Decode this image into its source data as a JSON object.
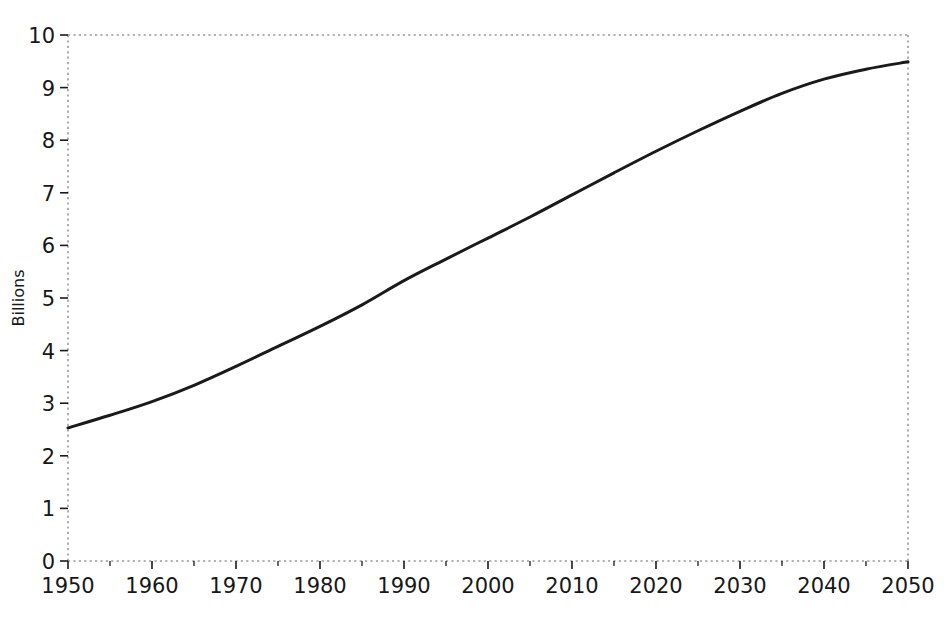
{
  "chart_data": {
    "type": "line",
    "title": "",
    "subtitle": "",
    "xlabel": "",
    "ylabel": "Billions",
    "xlim": [
      1950,
      2050
    ],
    "ylim": [
      0,
      10
    ],
    "grid": false,
    "legend": null,
    "x_major_ticks": [
      1950,
      1960,
      1970,
      1980,
      1990,
      2000,
      2010,
      2020,
      2030,
      2040,
      2050
    ],
    "x_minor_ticks": [
      1955,
      1965,
      1975,
      1985,
      1995,
      2005,
      2015,
      2025,
      2035,
      2045
    ],
    "x_tick_labels": [
      "1950",
      "1960",
      "1970",
      "1980",
      "1990",
      "2000",
      "2010",
      "2020",
      "2030",
      "2040",
      "2050"
    ],
    "y_major_ticks": [
      0,
      1,
      2,
      3,
      4,
      5,
      6,
      7,
      8,
      9,
      10
    ],
    "y_tick_labels": [
      "0",
      "1",
      "2",
      "3",
      "4",
      "5",
      "6",
      "7",
      "8",
      "9",
      "10"
    ],
    "series": [
      {
        "name": "World population",
        "color": "#1a1a1a",
        "line_width": 3,
        "x": [
          1950,
          1955,
          1960,
          1965,
          1970,
          1975,
          1980,
          1985,
          1990,
          1995,
          2000,
          2005,
          2010,
          2015,
          2020,
          2025,
          2030,
          2035,
          2040,
          2045,
          2050
        ],
        "values": [
          2.53,
          2.77,
          3.03,
          3.34,
          3.7,
          4.08,
          4.46,
          4.87,
          5.33,
          5.74,
          6.14,
          6.54,
          6.96,
          7.38,
          7.79,
          8.18,
          8.55,
          8.89,
          9.16,
          9.35,
          9.49
        ]
      }
    ],
    "axis_style": {
      "spine_color": "#9a9a9a",
      "spine_dash": "dotted",
      "tick_color": "#1a1a1a",
      "background": "#ffffff"
    }
  }
}
